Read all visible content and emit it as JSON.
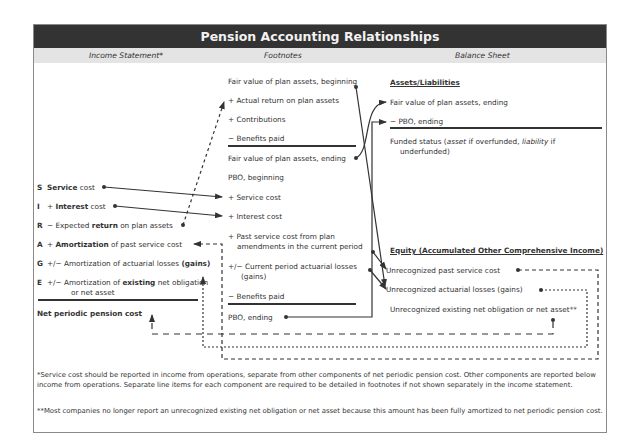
{
  "title": "Pension Accounting Relationships",
  "columns": {
    "income_statement": "Income Statement*",
    "footnotes": "Footnotes",
    "balance_sheet": "Balance Sheet"
  },
  "income_statement": {
    "items": [
      {
        "letter": "S",
        "pre": "",
        "bold": "Service",
        "post": " cost"
      },
      {
        "letter": "I",
        "pre": "+ ",
        "bold": "Interest",
        "post": " cost"
      },
      {
        "letter": "R",
        "pre": "− Expected ",
        "bold": "return",
        "post": " on plan assets"
      },
      {
        "letter": "A",
        "pre": "+ ",
        "bold": "Amortization",
        "post": " of past service cost"
      },
      {
        "letter": "G",
        "pre": "+/− Amortization of actuarial losses ",
        "bold": "(gains)",
        "post": ""
      },
      {
        "letter": "E",
        "pre": "+/− Amortization of ",
        "bold": "existing",
        "post": " net obligation"
      }
    ],
    "item_e_line2": "or net asset",
    "total": "Net periodic pension cost"
  },
  "footnotes": {
    "plan_assets": [
      "Fair value of plan assets, beginning",
      "+ Actual return on plan assets",
      "+ Contributions",
      "− Benefits paid",
      "Fair value of plan assets, ending"
    ],
    "pbo": [
      "PBO, beginning",
      "+ Service cost",
      "+ Interest cost",
      "+ Past service cost from plan",
      "amendments in the current period",
      "+/− Current period actuarial losses",
      "(gains)",
      "− Benefits paid",
      "PBO, ending"
    ]
  },
  "balance_sheet": {
    "assets_heading": "Assets/Liabilities",
    "assets_items": [
      "Fair value of plan assets, ending",
      "−  PBO, ending"
    ],
    "funded_status": {
      "pre": "Funded status (",
      "asset": "asset",
      "mid": " if overfunded, ",
      "liability": "liability",
      "post": " if",
      "line2": "underfunded)"
    },
    "equity_heading": "Equity (Accumulated Other Comprehensive Income)",
    "equity_items": [
      "Unrecognized past service cost",
      "Unrecognized actuarial losses (gains)",
      "Unrecognized existing net obligation or net asset**"
    ]
  },
  "notes": {
    "note1": "*Service cost should be reported in income from operations, separate from other components of net periodic pension cost. Other components are reported below income from operations. Separate line items for each component are required to be detailed in footnotes if not shown separately in the income statement.",
    "note2": "**Most companies no longer report an unrecognized existing net obligation or net asset because this amount has been fully amortized to net periodic pension cost."
  },
  "colors": {
    "title_bg": "#333333",
    "subhead_bg": "#e4e4e4",
    "line": "#333333"
  }
}
